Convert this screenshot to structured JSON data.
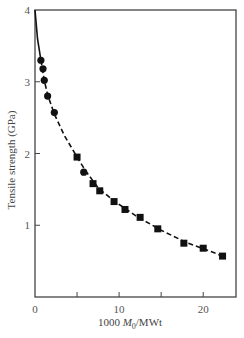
{
  "chart_data": {
    "type": "scatter",
    "title": "",
    "xlabel": "1000 M0/MWt",
    "xlabel_parts": {
      "prefix": "1000 ",
      "var": "M",
      "sub": "0",
      "suffix": "/MWt"
    },
    "ylabel": "Tensile strength (GPa)",
    "xlim": [
      0,
      23.9
    ],
    "ylim": [
      0,
      4
    ],
    "x_ticks": [
      0,
      5,
      10,
      15,
      20
    ],
    "x_tick_labels": [
      "0",
      "",
      "10",
      "",
      "20"
    ],
    "y_ticks": [
      1,
      2,
      3,
      4
    ],
    "y_tick_labels": [
      "1",
      "2",
      "3",
      "4"
    ],
    "grid": false,
    "legend": null,
    "series": [
      {
        "name": "circles",
        "marker": "circle",
        "x": [
          0.7,
          0.95,
          1.1,
          1.5,
          2.3,
          5.8
        ],
        "y": [
          3.3,
          3.18,
          3.02,
          2.8,
          2.57,
          1.74
        ]
      },
      {
        "name": "squares",
        "marker": "square",
        "x": [
          5.0,
          6.9,
          7.7,
          9.4,
          10.7,
          12.5,
          14.6,
          17.7,
          20.0,
          22.3
        ],
        "y": [
          1.95,
          1.58,
          1.48,
          1.33,
          1.22,
          1.11,
          0.95,
          0.75,
          0.68,
          0.57
        ]
      }
    ],
    "fit_curve": {
      "style": "solid-then-dashed",
      "x": [
        0,
        0.3,
        0.7,
        1.1,
        1.5,
        2.3,
        3.5,
        5.0,
        6.0,
        7.5,
        9.5,
        12.0,
        15.0,
        18.0,
        21.0,
        22.3
      ],
      "y": [
        4.0,
        3.6,
        3.3,
        3.02,
        2.82,
        2.55,
        2.25,
        1.95,
        1.76,
        1.52,
        1.33,
        1.13,
        0.93,
        0.76,
        0.63,
        0.57
      ]
    }
  }
}
